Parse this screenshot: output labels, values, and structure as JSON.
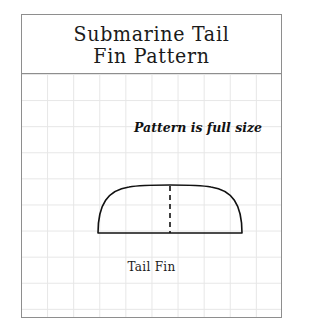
{
  "sheet": {
    "title_lines": [
      "Submarine Tail",
      "Fin Pattern"
    ],
    "note": "Pattern is full size",
    "part_label": "Tail Fin",
    "border_color": "#8e8e8e",
    "grid_color": "#e6e6e6",
    "ink_color": "#111111",
    "background": "#ffffff"
  },
  "drawing": {
    "outline_name": "tail-fin-outline",
    "centerline_name": "fin-center-dashed-line",
    "centerline_style": "dashed",
    "outline_stroke_width": 1.6,
    "centerline_stroke_width": 1.6
  }
}
